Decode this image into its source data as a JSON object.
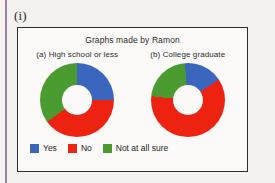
{
  "item_label": "(i)",
  "figure": {
    "title": "Graphs made by Ramon"
  },
  "legend": {
    "items": [
      {
        "label": "Yes",
        "color": "#3a66bd"
      },
      {
        "label": "No",
        "color": "#ee2211"
      },
      {
        "label": "Not at all sure",
        "color": "#4a9b30"
      }
    ]
  },
  "chart_data": [
    {
      "type": "pie",
      "title": "(a) High school or less",
      "categories": [
        "Yes",
        "No",
        "Not at all sure"
      ],
      "values": [
        25,
        40,
        35
      ],
      "colors": [
        "#3a66bd",
        "#ee2211",
        "#4a9b30"
      ],
      "start_angle": 0,
      "donut": true,
      "legend_position": "bottom"
    },
    {
      "type": "pie",
      "title": "(b) College graduate",
      "categories": [
        "Yes",
        "No",
        "Not at all sure"
      ],
      "values": [
        17,
        61,
        22
      ],
      "colors": [
        "#3a66bd",
        "#ee2211",
        "#4a9b30"
      ],
      "start_angle": -5,
      "donut": true,
      "legend_position": "bottom"
    }
  ]
}
